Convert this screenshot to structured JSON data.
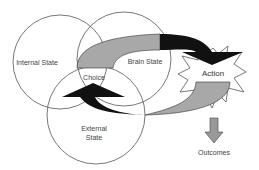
{
  "diagram": {
    "nodes": {
      "internal_state": "Internal State",
      "brain_state": "Brain State",
      "choice": "Choice",
      "external_state_line1": "External",
      "external_state_line2": "State",
      "action": "Action",
      "outcomes": "Outcomes"
    },
    "colors": {
      "circle_stroke": "#555555",
      "arrow_gray": "#a8a8a8",
      "arrow_black": "#111111",
      "text": "#444444"
    }
  }
}
